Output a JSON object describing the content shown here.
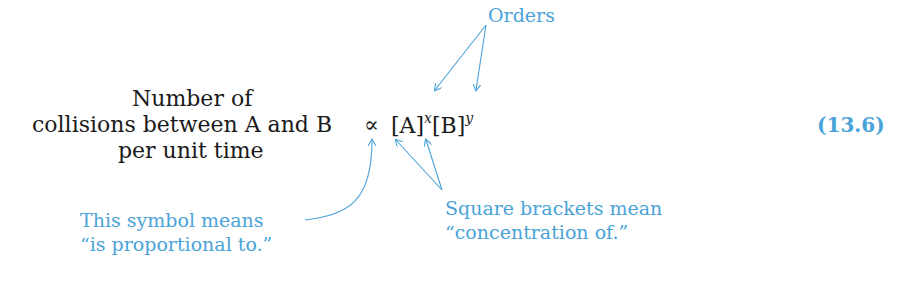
{
  "equation": {
    "lhs_lines": [
      "Number of",
      "collisions between A and B",
      "per unit time"
    ],
    "relation_symbol": "∝",
    "rhs": {
      "term1": "[A]",
      "exp1": "x",
      "term2": "[B]",
      "exp2": "y"
    },
    "number": "(13.6)"
  },
  "annotations": {
    "orders": "Orders",
    "symbol_note_line1": "This symbol means",
    "symbol_note_line2": "“is proportional to.”",
    "brackets_note_line1": "Square brackets mean",
    "brackets_note_line2": "“concentration of.”"
  },
  "colors": {
    "annotation": "#4aa3d8",
    "text": "#1a1a1a"
  }
}
